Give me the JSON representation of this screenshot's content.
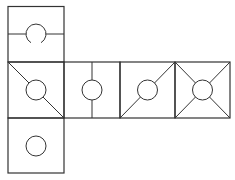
{
  "diagram": {
    "title": "",
    "stroke_color": "#333333",
    "background": "#ffffff",
    "faces": [
      {
        "id": "top",
        "x": 8,
        "y": 6,
        "size": 56,
        "pattern": "horizontal-line-through-open-circle"
      },
      {
        "id": "middle-1",
        "x": 8,
        "y": 62,
        "size": 56,
        "pattern": "diagonal-tl-br-with-circle"
      },
      {
        "id": "middle-2",
        "x": 64,
        "y": 62,
        "size": 56,
        "pattern": "vertical-line-through-circle"
      },
      {
        "id": "middle-3",
        "x": 120,
        "y": 62,
        "size": 55,
        "pattern": "diagonal-bl-tr-with-circle"
      },
      {
        "id": "middle-4",
        "x": 175,
        "y": 62,
        "size": 55,
        "pattern": "both-diagonals-with-circle"
      },
      {
        "id": "bottom",
        "x": 8,
        "y": 118,
        "size": 56,
        "pattern": "circle-only"
      }
    ],
    "circle_radius": 10
  }
}
